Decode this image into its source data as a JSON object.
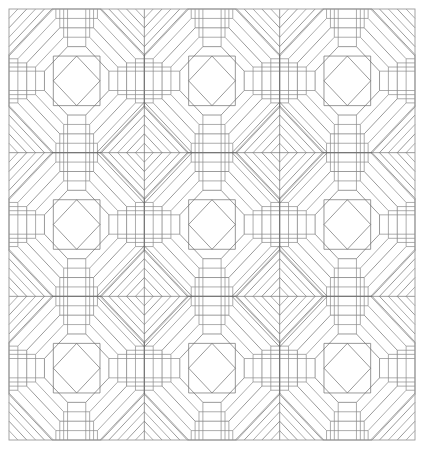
{
  "document": {
    "title": "Concentric Octagon Quilt Block Pattern",
    "kind": "line-diagram",
    "width": 429,
    "height": 451,
    "background_color": "#ffffff"
  },
  "style": {
    "line_color": "#8a8a8a",
    "line_color_dark": "#6f6f6f",
    "frame_color": "#9a9a9a",
    "line_width": 0.7,
    "frame_width": 0.9
  },
  "frame": {
    "name": "outer-border",
    "x": 9,
    "y": 9,
    "width": 406,
    "height": 431
  },
  "grid": {
    "columns": 3,
    "rows": 3,
    "cell_width": 135.33,
    "cell_height": 143.67,
    "origin_x": 9,
    "origin_y": 9,
    "vertical_dividers": [
      144.33,
      279.67
    ],
    "horizontal_dividers": [
      152.67,
      296.33
    ]
  },
  "block": {
    "name": "log-cabin-octagon-block",
    "description": "Square block with central square containing an inscribed diamond, surrounded by concentric octagonal rings built from straight strips; each block corner carries nested chevrons that meet neighbouring blocks to form diamonds.",
    "ring_count": 5,
    "center_square_fraction": 0.345,
    "has_center_diamond": true,
    "corner_chevron_count": 5
  },
  "motifs": [
    {
      "name": "center-square",
      "count": 9,
      "shape": "square"
    },
    {
      "name": "center-diamond",
      "count": 9,
      "shape": "rotated-square"
    },
    {
      "name": "octagon-ring",
      "count": 45,
      "shape": "octagon"
    },
    {
      "name": "junction-diamond",
      "count": 4,
      "shape": "diamond"
    },
    {
      "name": "edge-half-diamond",
      "count": 8,
      "shape": "triangle-pair"
    }
  ],
  "chart_data": {
    "type": "table",
    "categories": [
      "blocks",
      "rings per block",
      "center squares",
      "center diamonds",
      "junction diamonds"
    ],
    "values": [
      9,
      5,
      9,
      9,
      4
    ]
  }
}
